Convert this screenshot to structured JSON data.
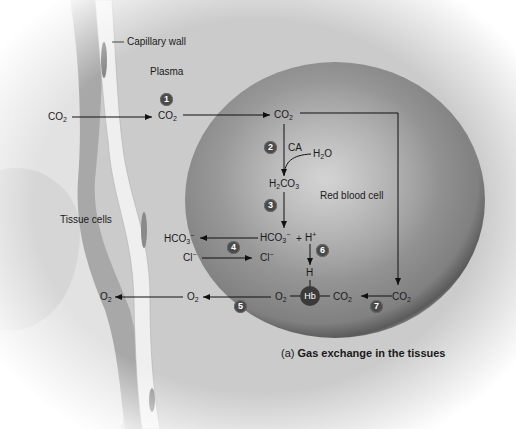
{
  "figure": {
    "caption_prefix": "(a)",
    "caption_title": "Gas exchange in the tissues"
  },
  "regions": {
    "capillary_wall": "Capillary wall",
    "plasma": "Plasma",
    "tissue_cells": "Tissue cells",
    "red_blood_cell": "Red blood cell"
  },
  "molecules": {
    "co2_tissue": {
      "base": "CO",
      "sub": "2"
    },
    "co2_plasma": {
      "base": "CO",
      "sub": "2"
    },
    "co2_rbc": {
      "base": "CO",
      "sub": "2"
    },
    "enzyme": "CA",
    "h2o": {
      "a": "H",
      "sub": "2",
      "b": "O"
    },
    "h2co3": {
      "a": "H",
      "sub1": "2",
      "b": "CO",
      "sub2": "3"
    },
    "hco3_rbc": {
      "base": "HCO",
      "sub": "3",
      "sup": "−"
    },
    "plus": "+",
    "h_plus": {
      "base": "H",
      "sup": "+"
    },
    "hco3_plasma": {
      "base": "HCO",
      "sub": "3",
      "sup": "−"
    },
    "cl_plasma": {
      "base": "Cl",
      "sup": "−"
    },
    "cl_rbc": {
      "base": "Cl",
      "sup": "−"
    },
    "h_bound": "H",
    "hb": "Hb",
    "o2_hb": {
      "base": "O",
      "sub": "2"
    },
    "co2_hb": {
      "base": "CO",
      "sub": "2"
    },
    "co2_right": {
      "base": "CO",
      "sub": "2"
    },
    "o2_plasma": {
      "base": "O",
      "sub": "2"
    },
    "o2_tissue": {
      "base": "O",
      "sub": "2"
    }
  },
  "steps": [
    "1",
    "2",
    "3",
    "4",
    "5",
    "6",
    "7"
  ],
  "colors": {
    "rbc_edge": "#5a5a5a",
    "rbc_center": "#b8b8b8",
    "plasma": "#cfcfcf",
    "capillary_wall": "#ececec",
    "step_badge": "#4a4a4a"
  }
}
